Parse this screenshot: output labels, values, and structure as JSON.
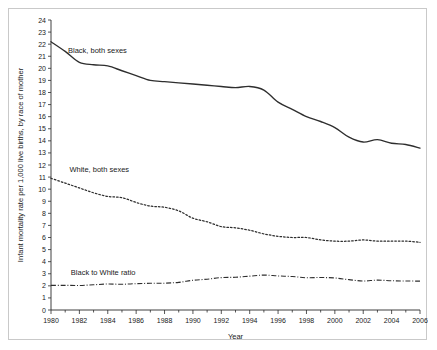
{
  "figure": {
    "border_color": "#c9c9c9",
    "background": "#ffffff"
  },
  "chart_data": {
    "type": "line",
    "title": "",
    "xlabel": "Year",
    "ylabel": "Infant mortality rate per 1,000 live births, by race of mother",
    "xlim": [
      1980,
      2006
    ],
    "ylim": [
      0,
      24
    ],
    "grid": false,
    "legend_position": "inline-annotations",
    "y_ticks": [
      0,
      1,
      2,
      3,
      4,
      5,
      6,
      7,
      8,
      9,
      10,
      11,
      12,
      13,
      14,
      15,
      16,
      17,
      18,
      19,
      20,
      21,
      22,
      23,
      24
    ],
    "x_ticks_labeled": [
      1980,
      1982,
      1984,
      1986,
      1988,
      1990,
      1992,
      1994,
      1996,
      1998,
      2000,
      2002,
      2004,
      2006
    ],
    "x_ticks_minor_every": 1,
    "x": [
      1980,
      1981,
      1982,
      1983,
      1984,
      1985,
      1986,
      1987,
      1988,
      1989,
      1990,
      1991,
      1992,
      1993,
      1994,
      1995,
      1996,
      1997,
      1998,
      1999,
      2000,
      2001,
      2002,
      2003,
      2004,
      2005,
      2006
    ],
    "series": [
      {
        "name": "Black, both sexes",
        "label": "Black, both sexes",
        "style": "solid",
        "color": "#2e2e2e",
        "label_x": 1981.2,
        "label_y": 21.3,
        "values": [
          22.2,
          21.4,
          20.5,
          20.3,
          20.2,
          19.8,
          19.4,
          19.0,
          18.9,
          18.8,
          18.7,
          18.6,
          18.5,
          18.4,
          18.5,
          18.2,
          17.2,
          16.6,
          16.0,
          15.6,
          15.1,
          14.3,
          13.9,
          14.1,
          13.8,
          13.7,
          13.4
        ]
      },
      {
        "name": "White, both sexes",
        "label": "White, both sexes",
        "style": "dotted",
        "color": "#2e2e2e",
        "label_x": 1981.3,
        "label_y": 11.4,
        "values": [
          10.9,
          10.5,
          10.1,
          9.7,
          9.4,
          9.3,
          8.9,
          8.6,
          8.5,
          8.2,
          7.6,
          7.3,
          6.9,
          6.8,
          6.6,
          6.3,
          6.1,
          6.0,
          6.0,
          5.8,
          5.7,
          5.7,
          5.8,
          5.7,
          5.7,
          5.7,
          5.6
        ]
      },
      {
        "name": "Black to White ratio",
        "label": "Black to White ratio",
        "style": "dashdot",
        "color": "#2e2e2e",
        "label_x": 1981.4,
        "label_y": 2.9,
        "values": [
          2.04,
          2.04,
          2.03,
          2.09,
          2.15,
          2.13,
          2.18,
          2.21,
          2.22,
          2.29,
          2.46,
          2.55,
          2.68,
          2.71,
          2.8,
          2.89,
          2.82,
          2.77,
          2.67,
          2.69,
          2.65,
          2.51,
          2.4,
          2.47,
          2.42,
          2.4,
          2.39
        ]
      }
    ]
  }
}
